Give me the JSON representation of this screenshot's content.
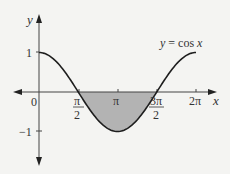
{
  "chart_data": {
    "type": "line",
    "title": "",
    "curve_label": "y = cos x",
    "xlabel": "x",
    "ylabel": "y",
    "x_ticks": [
      {
        "value": 1.5708,
        "label_num": "π",
        "label_den": "2"
      },
      {
        "value": 3.1416,
        "label": "π"
      },
      {
        "value": 4.7124,
        "label_num": "3π",
        "label_den": "2"
      },
      {
        "value": 6.2832,
        "label": "2π"
      }
    ],
    "y_ticks": [
      {
        "value": 1,
        "label": "1"
      },
      {
        "value": -1,
        "label": "−1"
      }
    ],
    "origin_label": "0",
    "xlim": [
      -0.5,
      6.8
    ],
    "ylim": [
      -1.9,
      1.35
    ],
    "series": [
      {
        "name": "y = cos x",
        "function": "cos(x)",
        "domain": [
          0,
          6.2832
        ],
        "x": [
          0,
          0.785,
          1.571,
          2.356,
          3.142,
          3.927,
          4.712,
          5.498,
          6.283
        ],
        "y": [
          1,
          0.707,
          0,
          -0.707,
          -1,
          -0.707,
          0,
          0.707,
          1
        ]
      }
    ],
    "shaded_region": {
      "from": 1.5708,
      "to": 4.7124,
      "description": "area between curve and x-axis where cos x < 0",
      "color": "#b3b3b3"
    },
    "grid": false,
    "colors": {
      "curve": "#222222",
      "axis": "#333333",
      "shade": "#b3b3b3",
      "background": "#f4f4f2"
    }
  },
  "labels": {
    "y_axis": "y",
    "x_axis": "x",
    "origin": "0",
    "one": "1",
    "minus_one": "−1",
    "pi_num": "π",
    "pi_den": "2",
    "pi": "π",
    "three_pi_num": "3π",
    "three_pi_den": "2",
    "two_pi": "2π",
    "curve_label_y": "y",
    "curve_label_rest": " = cos ",
    "curve_label_x": "x"
  }
}
